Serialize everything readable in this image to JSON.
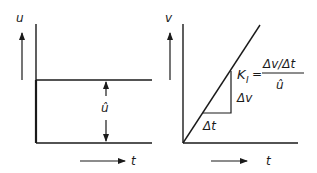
{
  "left_plot": {
    "y_axis_label": "u",
    "x_axis_label": "t",
    "amplitude_label": "û",
    "description": "Step input: constant level û from t=0"
  },
  "right_plot": {
    "y_axis_label": "v",
    "x_axis_label": "t",
    "delta_t_label": "Δt",
    "delta_v_label": "Δv",
    "gain_symbol": "K",
    "gain_subscript": "I",
    "equals": "=",
    "fraction_numerator": "Δv/Δt",
    "fraction_denominator": "û",
    "description": "Ramp response of integral element"
  },
  "colors": {
    "line": "#1a1a1a",
    "background": "#ffffff"
  }
}
